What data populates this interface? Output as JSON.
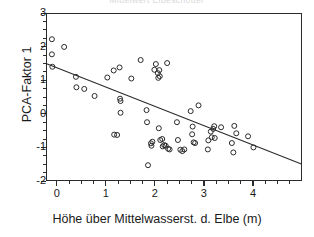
{
  "chart_data": {
    "type": "scatter",
    "title": "Mittelwert Elbeschotter",
    "xlabel": "Höhe über Mittelwasserst. d. Elbe (m)",
    "ylabel": "PCA-Faktor 1",
    "xlim": [
      -0.22,
      5.0
    ],
    "ylim": [
      -2,
      3
    ],
    "xticks": [
      0,
      1,
      2,
      3,
      4
    ],
    "yticks": [
      -2,
      -1,
      0,
      1,
      2,
      3
    ],
    "xtick_labels": [
      "0",
      "1",
      "2",
      "3",
      "4"
    ],
    "ytick_labels": [
      "-2",
      "-1",
      "0",
      "1",
      "2",
      "3"
    ],
    "x_minor_step": 0.25,
    "y_minor_step": 0.25,
    "grid": false,
    "legend": null,
    "marker": "open-circle",
    "marker_size": 5,
    "marker_color": "#2b2b2b",
    "line_color": "#2b2b2b",
    "frame_color": "#2b2b2b",
    "background": "#ffffff",
    "trendline": {
      "type": "linear-regression",
      "slope": -0.575,
      "intercept": 1.372,
      "x_start": -0.22,
      "y_start": 1.499,
      "x_end": 5.0,
      "y_end": -1.503
    },
    "points": [
      {
        "x": -0.1,
        "y": 2.22
      },
      {
        "x": -0.1,
        "y": 1.77
      },
      {
        "x": -0.09,
        "y": 1.4
      },
      {
        "x": 0.15,
        "y": 1.99
      },
      {
        "x": 0.39,
        "y": 1.1
      },
      {
        "x": 0.4,
        "y": 0.79
      },
      {
        "x": 0.56,
        "y": 0.74
      },
      {
        "x": 0.77,
        "y": 0.53
      },
      {
        "x": 1.03,
        "y": 1.08
      },
      {
        "x": 1.16,
        "y": 1.29
      },
      {
        "x": 1.17,
        "y": -0.62
      },
      {
        "x": 1.23,
        "y": -0.63
      },
      {
        "x": 1.28,
        "y": 1.38
      },
      {
        "x": 1.29,
        "y": 0.45
      },
      {
        "x": 1.3,
        "y": 0.38
      },
      {
        "x": 1.3,
        "y": 0.03
      },
      {
        "x": 1.52,
        "y": 1.05
      },
      {
        "x": 1.71,
        "y": 1.6
      },
      {
        "x": 1.83,
        "y": 0.11
      },
      {
        "x": 1.84,
        "y": -0.25
      },
      {
        "x": 1.86,
        "y": -1.53
      },
      {
        "x": 1.92,
        "y": -0.88
      },
      {
        "x": 1.93,
        "y": -0.95
      },
      {
        "x": 1.95,
        "y": -0.83
      },
      {
        "x": 1.99,
        "y": 1.31
      },
      {
        "x": 2.02,
        "y": 1.48
      },
      {
        "x": 2.06,
        "y": 1.21
      },
      {
        "x": 2.07,
        "y": 1.07
      },
      {
        "x": 2.09,
        "y": 1.3
      },
      {
        "x": 2.1,
        "y": 1.12
      },
      {
        "x": 2.08,
        "y": -0.43
      },
      {
        "x": 2.11,
        "y": -0.78
      },
      {
        "x": 2.15,
        "y": -0.75
      },
      {
        "x": 2.16,
        "y": -0.97
      },
      {
        "x": 2.19,
        "y": -0.93
      },
      {
        "x": 2.22,
        "y": -0.95
      },
      {
        "x": 2.25,
        "y": 1.51
      },
      {
        "x": 2.27,
        "y": -1.04
      },
      {
        "x": 2.3,
        "y": -1.06
      },
      {
        "x": 2.45,
        "y": -0.25
      },
      {
        "x": 2.47,
        "y": -0.78
      },
      {
        "x": 2.52,
        "y": -1.07
      },
      {
        "x": 2.56,
        "y": -1.11
      },
      {
        "x": 2.6,
        "y": -1.06
      },
      {
        "x": 2.73,
        "y": 0.08
      },
      {
        "x": 2.76,
        "y": -0.61
      },
      {
        "x": 2.77,
        "y": -0.38
      },
      {
        "x": 2.79,
        "y": -0.85
      },
      {
        "x": 2.82,
        "y": -0.87
      },
      {
        "x": 2.89,
        "y": 0.25
      },
      {
        "x": 3.08,
        "y": -1.06
      },
      {
        "x": 3.09,
        "y": -0.79
      },
      {
        "x": 3.14,
        "y": -0.53
      },
      {
        "x": 3.16,
        "y": -0.7
      },
      {
        "x": 3.19,
        "y": -0.45
      },
      {
        "x": 3.21,
        "y": -0.37
      },
      {
        "x": 3.22,
        "y": -0.72
      },
      {
        "x": 3.35,
        "y": -0.4
      },
      {
        "x": 3.57,
        "y": -0.87
      },
      {
        "x": 3.6,
        "y": -1.15
      },
      {
        "x": 3.62,
        "y": -0.36
      },
      {
        "x": 3.66,
        "y": -0.58
      },
      {
        "x": 3.9,
        "y": -0.67
      },
      {
        "x": 4.01,
        "y": -1.0
      }
    ]
  }
}
